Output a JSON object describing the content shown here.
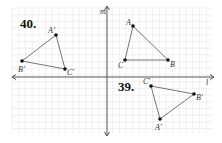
{
  "problems": [
    {
      "number": "40.",
      "label_pos": [
        20,
        28
      ]
    },
    {
      "number": "39.",
      "label_pos": [
        118,
        91
      ]
    }
  ],
  "axes": {
    "vertical": {
      "label": "m",
      "x": 107,
      "y_top": 6,
      "y_bottom": 136
    },
    "horizontal": {
      "label": "l",
      "y": 77,
      "x_left": 12,
      "x_right": 214
    }
  },
  "grid": {
    "x0": 12,
    "y0": 8,
    "x1": 212,
    "y1": 134,
    "step": 6.7,
    "color": "#e6e6e6"
  },
  "triangles": [
    {
      "name": "ABC",
      "vertices": [
        {
          "label": "A",
          "x": 133,
          "y": 26
        },
        {
          "label": "B",
          "x": 168,
          "y": 60
        },
        {
          "label": "C",
          "x": 125,
          "y": 60
        }
      ]
    },
    {
      "name": "A'B'C' (39)",
      "vertices": [
        {
          "label": "A'",
          "x": 160,
          "y": 119
        },
        {
          "label": "B'",
          "x": 194,
          "y": 94
        },
        {
          "label": "C'",
          "x": 151,
          "y": 86
        }
      ]
    },
    {
      "name": "A'B'C' (40)",
      "vertices": [
        {
          "label": "A'",
          "x": 56,
          "y": 35
        },
        {
          "label": "B'",
          "x": 22,
          "y": 61
        },
        {
          "label": "C'",
          "x": 65,
          "y": 69
        }
      ]
    }
  ]
}
